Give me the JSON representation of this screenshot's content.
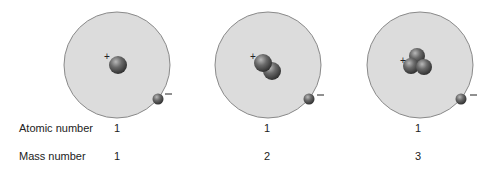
{
  "colors": {
    "atom_fill": "#dcdcdc",
    "atom_stroke": "#8a8a8a",
    "particle_dark": "#3e3e3e",
    "particle_light": "#9a9a9a",
    "text": "#222222"
  },
  "atoms": [
    {
      "name": "hydrogen-1",
      "center": [
        117,
        65
      ],
      "radius": 53,
      "nucleus": [
        [
          118,
          65
        ]
      ],
      "nucleus_radius": 9,
      "plus": [
        107,
        57
      ],
      "electron": [
        158,
        99
      ],
      "minus": [
        168,
        94
      ],
      "atomic_number": "1",
      "mass_number": "1"
    },
    {
      "name": "hydrogen-2",
      "center": [
        268,
        65
      ],
      "radius": 53,
      "nucleus": [
        [
          272,
          71
        ],
        [
          263,
          63
        ]
      ],
      "nucleus_radius": 9,
      "plus": [
        253,
        57
      ],
      "electron": [
        309,
        99
      ],
      "minus": [
        320,
        95
      ],
      "atomic_number": "1",
      "mass_number": "2"
    },
    {
      "name": "hydrogen-3",
      "center": [
        420,
        65
      ],
      "radius": 53,
      "nucleus": [
        [
          417,
          56
        ],
        [
          411,
          66
        ],
        [
          424,
          67
        ]
      ],
      "nucleus_radius": 8,
      "plus": [
        403,
        61
      ],
      "electron": [
        461,
        99
      ],
      "minus": [
        473,
        95
      ],
      "atomic_number": "1",
      "mass_number": "3"
    }
  ],
  "labels": {
    "plus": "+",
    "minus": "−",
    "atomic_number": "Atomic number",
    "mass_number": "Mass number"
  },
  "values": {
    "atomic": [
      "1",
      "1",
      "1"
    ],
    "mass": [
      "1",
      "2",
      "3"
    ]
  }
}
